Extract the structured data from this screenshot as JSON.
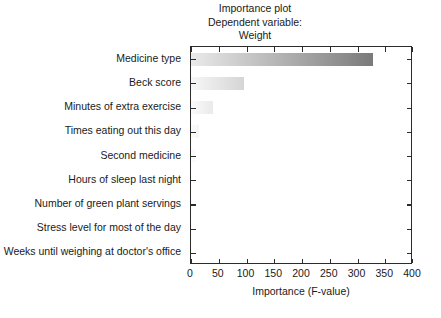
{
  "chart_data": {
    "type": "bar",
    "orientation": "horizontal",
    "title": "Importance plot",
    "subtitle": "Dependent variable:",
    "subtitle2": "Weight",
    "xlabel": "Importance (F-value)",
    "ylabel": "",
    "xlim": [
      0,
      400
    ],
    "xticks": [
      0,
      50,
      100,
      150,
      200,
      250,
      300,
      350,
      400
    ],
    "xtick_labels": [
      "0",
      "50",
      "100",
      "150",
      "200",
      "250",
      "300",
      "350",
      "400"
    ],
    "grid": false,
    "legend": null,
    "categories": [
      "Medicine type",
      "Beck score",
      "Minutes of extra exercise",
      "Times eating out this day",
      "Second medicine",
      "Hours of sleep last night",
      "Number of green plant servings",
      "Stress level for most of the day",
      "Weeks until weighing at doctor's office"
    ],
    "values": [
      328,
      95,
      40,
      14,
      8,
      0,
      0,
      0,
      0
    ],
    "bar_gradient_start_color": "#fafafa",
    "bar_gradient_end_color": "#7a7a7a",
    "axis_color": "#2b2b2b",
    "background_color": "#ffffff"
  }
}
